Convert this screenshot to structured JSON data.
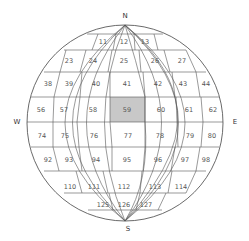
{
  "diagram": {
    "type": "globe-grid",
    "compass": {
      "north": "N",
      "south": "S",
      "east": "E",
      "west": "W"
    },
    "highlight": {
      "cell": "59",
      "color": "#c8c8c8"
    },
    "rows": [
      {
        "cells": [
          {
            "label": "11",
            "x": 103,
            "y": 42
          },
          {
            "label": "12",
            "x": 124,
            "y": 42
          },
          {
            "label": "13",
            "x": 145,
            "y": 42
          }
        ]
      },
      {
        "cells": [
          {
            "label": "23",
            "x": 69,
            "y": 61
          },
          {
            "label": "24",
            "x": 93,
            "y": 61
          },
          {
            "label": "25",
            "x": 124,
            "y": 61
          },
          {
            "label": "26",
            "x": 155,
            "y": 61
          },
          {
            "label": "27",
            "x": 182,
            "y": 61
          }
        ]
      },
      {
        "cells": [
          {
            "label": "38",
            "x": 48,
            "y": 84
          },
          {
            "label": "39",
            "x": 69,
            "y": 84
          },
          {
            "label": "40",
            "x": 96,
            "y": 84
          },
          {
            "label": "41",
            "x": 127,
            "y": 84
          },
          {
            "label": "42",
            "x": 158,
            "y": 84
          },
          {
            "label": "43",
            "x": 183,
            "y": 84
          },
          {
            "label": "44",
            "x": 206,
            "y": 84
          }
        ]
      },
      {
        "cells": [
          {
            "label": "56",
            "x": 41,
            "y": 110
          },
          {
            "label": "57",
            "x": 64,
            "y": 110
          },
          {
            "label": "58",
            "x": 93,
            "y": 110
          },
          {
            "label": "59",
            "x": 127,
            "y": 110
          },
          {
            "label": "60",
            "x": 161,
            "y": 110
          },
          {
            "label": "61",
            "x": 189,
            "y": 110
          },
          {
            "label": "62",
            "x": 213,
            "y": 110
          }
        ]
      },
      {
        "cells": [
          {
            "label": "74",
            "x": 42,
            "y": 136
          },
          {
            "label": "75",
            "x": 65,
            "y": 136
          },
          {
            "label": "76",
            "x": 94,
            "y": 136
          },
          {
            "label": "77",
            "x": 128,
            "y": 136
          },
          {
            "label": "78",
            "x": 160,
            "y": 136
          },
          {
            "label": "79",
            "x": 190,
            "y": 136
          },
          {
            "label": "80",
            "x": 212,
            "y": 136
          }
        ]
      },
      {
        "cells": [
          {
            "label": "92",
            "x": 48,
            "y": 160
          },
          {
            "label": "93",
            "x": 69,
            "y": 160
          },
          {
            "label": "94",
            "x": 96,
            "y": 160
          },
          {
            "label": "95",
            "x": 127,
            "y": 160
          },
          {
            "label": "96",
            "x": 158,
            "y": 160
          },
          {
            "label": "97",
            "x": 185,
            "y": 160
          },
          {
            "label": "98",
            "x": 206,
            "y": 160
          }
        ]
      },
      {
        "cells": [
          {
            "label": "110",
            "x": 70,
            "y": 187
          },
          {
            "label": "111",
            "x": 94,
            "y": 187
          },
          {
            "label": "112",
            "x": 124,
            "y": 187
          },
          {
            "label": "113",
            "x": 155,
            "y": 187
          },
          {
            "label": "114",
            "x": 181,
            "y": 187
          }
        ]
      },
      {
        "cells": [
          {
            "label": "125",
            "x": 103,
            "y": 205
          },
          {
            "label": "126",
            "x": 124,
            "y": 205
          },
          {
            "label": "127",
            "x": 146,
            "y": 205
          }
        ]
      }
    ]
  }
}
